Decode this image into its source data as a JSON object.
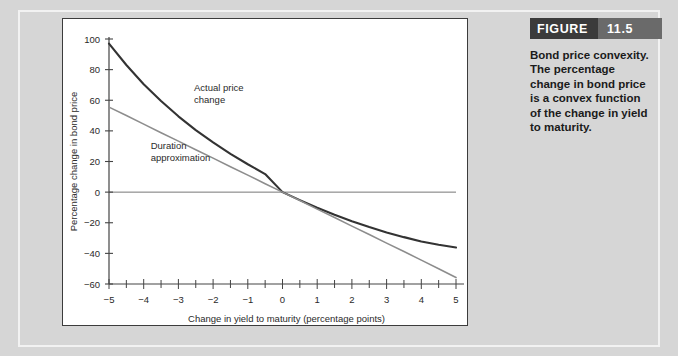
{
  "figure": {
    "badge_word": "FIGURE",
    "badge_number": "11.5",
    "caption": "Bond price convexity. The percentage change in bond price is a convex function of the change in yield to maturity.",
    "badge_bg": "#3b3b3b",
    "badge_num_bg": "#6a6a6a",
    "panel_bg": "#ffffff",
    "page_bg": "#d6d6d6"
  },
  "chart_data": {
    "type": "line",
    "title": "",
    "xlabel": "Change in yield to maturity (percentage points)",
    "ylabel": "Percentage change in bond price",
    "xlim": [
      -5,
      5
    ],
    "ylim": [
      -60,
      100
    ],
    "xticks": [
      -5,
      -4,
      -3,
      -2,
      -1,
      0,
      1,
      2,
      3,
      4,
      5
    ],
    "xtick_labels": [
      "−5",
      "−4",
      "−3",
      "−2",
      "−1",
      "0",
      "1",
      "2",
      "3",
      "4",
      "5"
    ],
    "yticks": [
      -60,
      -40,
      -20,
      0,
      20,
      40,
      60,
      80,
      100
    ],
    "ytick_labels": [
      "−60",
      "−40",
      "−20",
      "0",
      "20",
      "40",
      "60",
      "80",
      "100"
    ],
    "minor_xtick_step": 0.5,
    "grid": false,
    "legend": "inline-annotations",
    "zero_line": 0,
    "x": [
      -5,
      -4.5,
      -4,
      -3.5,
      -3,
      -2.5,
      -2,
      -1.5,
      -1,
      -0.5,
      0,
      0.5,
      1,
      1.5,
      2,
      2.5,
      3,
      3.5,
      4,
      4.5,
      5
    ],
    "series": [
      {
        "name": "Actual price change",
        "color": "#333333",
        "width": 2.1,
        "values": [
          97.0,
          83.0,
          70.5,
          59.5,
          49.5,
          40.5,
          32.5,
          25.0,
          18.2,
          11.8,
          0.0,
          -5.2,
          -10.2,
          -14.8,
          -19.0,
          -22.8,
          -26.3,
          -29.4,
          -32.2,
          -34.4,
          -36.2
        ]
      },
      {
        "name": "Duration approximation",
        "color": "#8d8d8d",
        "width": 1.6,
        "values": [
          55.5,
          50.0,
          44.4,
          38.8,
          33.3,
          27.7,
          22.2,
          16.6,
          11.1,
          5.5,
          0.0,
          -5.5,
          -11.1,
          -16.6,
          -22.2,
          -27.7,
          -33.3,
          -38.8,
          -44.4,
          -50.0,
          -55.8
        ]
      }
    ],
    "annotations": [
      {
        "text_line1": "Actual price",
        "text_line2": "change",
        "x": -2.55,
        "y": 66
      },
      {
        "text_line1": "Duration",
        "text_line2": "approximation",
        "x": -3.8,
        "y": 28
      }
    ]
  }
}
